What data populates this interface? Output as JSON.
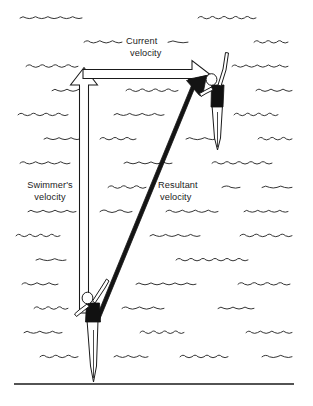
{
  "figure": {
    "background_color": "#ffffff",
    "ink_color": "#1a1a1a",
    "wave_color": "#2a2a2a",
    "width": 313,
    "height": 406
  },
  "labels": {
    "current": {
      "line1": "Current",
      "line2": "velocity"
    },
    "swimmer": {
      "line1": "Swimmer's",
      "line2": "velocity"
    },
    "resultant": {
      "line1": "Resultant",
      "line2": "velocity"
    }
  },
  "vectors": [
    {
      "name": "swimmers-velocity",
      "style": "hollow-outline",
      "direction": "up",
      "from": [
        84,
        312
      ],
      "to": [
        84,
        68
      ],
      "shaft_width": 9,
      "head_width": 21,
      "head_length": 17
    },
    {
      "name": "current-velocity",
      "style": "hollow-outline",
      "direction": "right",
      "from": [
        84,
        74
      ],
      "to": [
        210,
        74
      ],
      "shaft_width": 9,
      "head_width": 21,
      "head_length": 17
    },
    {
      "name": "resultant-velocity",
      "style": "solid-filled",
      "direction": "up-right",
      "from": [
        96,
        322
      ],
      "to": [
        206,
        76
      ],
      "shaft_width": 9,
      "head_width": 22,
      "head_length": 24
    }
  ],
  "swimmers": [
    {
      "name": "swimmer-start",
      "position": [
        84,
        312
      ],
      "description": "swimmer at origin of vectors"
    },
    {
      "name": "swimmer-end",
      "position": [
        212,
        80
      ],
      "description": "swimmer at resultant arrow tip"
    }
  ],
  "ground_line": {
    "name": "shore-line",
    "from": [
      14,
      384
    ],
    "to": [
      294,
      384
    ]
  },
  "waves": {
    "description": "staggered rows of small hand-drawn wave squiggles filling the water background",
    "rows": [
      [
        {
          "x": 20,
          "w": 62,
          "n": 5
        },
        {
          "x": 198,
          "w": 58,
          "n": 5
        }
      ],
      [
        {
          "x": 84,
          "w": 38,
          "n": 3
        },
        {
          "x": 168,
          "w": 20,
          "n": 1
        },
        {
          "x": 254,
          "w": 34,
          "n": 3
        }
      ],
      [
        {
          "x": 26,
          "w": 52,
          "n": 4
        },
        {
          "x": 232,
          "w": 56,
          "n": 5
        }
      ],
      [
        {
          "x": 52,
          "w": 36,
          "n": 3
        },
        {
          "x": 126,
          "w": 52,
          "n": 4
        },
        {
          "x": 256,
          "w": 36,
          "n": 3
        }
      ],
      [
        {
          "x": 18,
          "w": 50,
          "n": 4
        },
        {
          "x": 114,
          "w": 50,
          "n": 4
        },
        {
          "x": 234,
          "w": 44,
          "n": 4
        }
      ],
      [
        {
          "x": 44,
          "w": 36,
          "n": 3
        },
        {
          "x": 100,
          "w": 36,
          "n": 3
        },
        {
          "x": 186,
          "w": 30,
          "n": 2
        },
        {
          "x": 258,
          "w": 34,
          "n": 3
        }
      ],
      [
        {
          "x": 20,
          "w": 50,
          "n": 4
        },
        {
          "x": 124,
          "w": 48,
          "n": 4
        },
        {
          "x": 212,
          "w": 60,
          "n": 5
        }
      ],
      [
        {
          "x": 108,
          "w": 38,
          "n": 3
        },
        {
          "x": 222,
          "w": 18,
          "n": 1
        },
        {
          "x": 262,
          "w": 30,
          "n": 2
        }
      ],
      [
        {
          "x": 28,
          "w": 48,
          "n": 4
        },
        {
          "x": 100,
          "w": 32,
          "n": 2
        },
        {
          "x": 166,
          "w": 52,
          "n": 4
        },
        {
          "x": 244,
          "w": 44,
          "n": 4
        }
      ],
      [
        {
          "x": 16,
          "w": 44,
          "n": 4
        },
        {
          "x": 150,
          "w": 50,
          "n": 4
        },
        {
          "x": 240,
          "w": 52,
          "n": 4
        }
      ],
      [
        {
          "x": 36,
          "w": 30,
          "n": 2
        },
        {
          "x": 176,
          "w": 72,
          "n": 6
        }
      ],
      [
        {
          "x": 22,
          "w": 36,
          "n": 3
        },
        {
          "x": 136,
          "w": 60,
          "n": 5
        },
        {
          "x": 238,
          "w": 52,
          "n": 4
        }
      ],
      [
        {
          "x": 34,
          "w": 34,
          "n": 3
        },
        {
          "x": 122,
          "w": 42,
          "n": 3
        },
        {
          "x": 218,
          "w": 36,
          "n": 3
        }
      ],
      [
        {
          "x": 24,
          "w": 38,
          "n": 3
        },
        {
          "x": 140,
          "w": 44,
          "n": 4
        },
        {
          "x": 246,
          "w": 46,
          "n": 4
        }
      ],
      [
        {
          "x": 40,
          "w": 38,
          "n": 3
        },
        {
          "x": 114,
          "w": 34,
          "n": 3
        },
        {
          "x": 180,
          "w": 48,
          "n": 4
        },
        {
          "x": 262,
          "w": 30,
          "n": 2
        }
      ]
    ]
  }
}
